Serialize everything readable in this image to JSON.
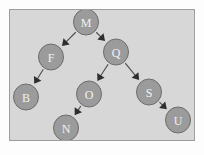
{
  "figure": {
    "panel": {
      "background_color": "#d7d7d7",
      "border_color": "#9e9e9e",
      "outer_background_color": "#fdfdfd"
    },
    "node_style": {
      "fill_color": "#9b9b9b",
      "stroke_color": "#6e6e6e",
      "label_color": "#f2f2f2",
      "radius": 13
    },
    "edge_style": {
      "line_color": "#4a4a4a",
      "arrow_color": "#2e2e2e"
    }
  },
  "chart_data": {
    "type": "diagram",
    "diagram_kind": "binary-search-tree",
    "title": "",
    "root": "M",
    "nodes": [
      {
        "id": "M",
        "label": "M",
        "x": 86,
        "y": 22,
        "r": 13,
        "depth": 0
      },
      {
        "id": "F",
        "label": "F",
        "x": 51,
        "y": 57,
        "r": 13,
        "depth": 1
      },
      {
        "id": "Q",
        "label": "Q",
        "x": 116,
        "y": 52,
        "r": 13,
        "depth": 1
      },
      {
        "id": "B",
        "label": "B",
        "x": 26,
        "y": 97,
        "r": 13,
        "depth": 2
      },
      {
        "id": "O",
        "label": "O",
        "x": 89,
        "y": 94,
        "r": 13,
        "depth": 2
      },
      {
        "id": "S",
        "label": "S",
        "x": 149,
        "y": 92,
        "r": 13,
        "depth": 2
      },
      {
        "id": "N",
        "label": "N",
        "x": 66,
        "y": 128,
        "r": 13,
        "depth": 3
      },
      {
        "id": "U",
        "label": "U",
        "x": 178,
        "y": 120,
        "r": 13,
        "depth": 3
      }
    ],
    "edges": [
      {
        "from": "M",
        "to": "F",
        "directed": true,
        "side": "left"
      },
      {
        "from": "M",
        "to": "Q",
        "directed": true,
        "side": "right"
      },
      {
        "from": "F",
        "to": "B",
        "directed": true,
        "side": "left"
      },
      {
        "from": "Q",
        "to": "O",
        "directed": true,
        "side": "left"
      },
      {
        "from": "Q",
        "to": "S",
        "directed": true,
        "side": "right"
      },
      {
        "from": "O",
        "to": "N",
        "directed": true,
        "side": "left"
      },
      {
        "from": "S",
        "to": "U",
        "directed": true,
        "side": "right"
      }
    ],
    "node_labels": [
      "M",
      "F",
      "Q",
      "B",
      "O",
      "S",
      "N",
      "U"
    ]
  }
}
